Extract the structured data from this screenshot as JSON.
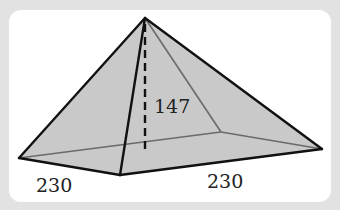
{
  "diagram": {
    "type": "square-pyramid",
    "labels": {
      "height": "147",
      "base_front_left": "230",
      "base_front_right": "230"
    },
    "colors": {
      "background": "#e2e2e2",
      "panel": "#ffffff",
      "face_fill": "#c9c9c9",
      "edge": "#111111",
      "hidden_edge": "#6a6a6a"
    }
  }
}
